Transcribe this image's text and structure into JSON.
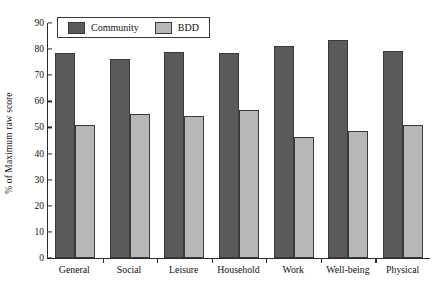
{
  "chart_data": {
    "type": "bar",
    "title": "",
    "xlabel": "",
    "ylabel": "% of Maximum raw score",
    "ylim": [
      0,
      90
    ],
    "ytick_step": 10,
    "yticks": [
      0,
      10,
      20,
      30,
      40,
      50,
      60,
      70,
      80,
      90
    ],
    "grid": false,
    "legend_position": "top-left-inside",
    "categories": [
      "General",
      "Social",
      "Leisure",
      "Household",
      "Work",
      "Well-being",
      "Physical"
    ],
    "series": [
      {
        "name": "Community",
        "color": "#5a5a5a",
        "values": [
          78.7,
          76.2,
          79.0,
          78.4,
          81.3,
          83.5,
          79.4
        ]
      },
      {
        "name": "BDD",
        "color": "#b7b7b7",
        "values": [
          51.0,
          55.0,
          54.3,
          56.5,
          46.5,
          48.5,
          51.0
        ]
      }
    ]
  },
  "colors": {
    "community": "#5a5a5a",
    "bdd": "#b7b7b7",
    "axis": "#2b2b2b",
    "bar_outline": "#3a3a3a",
    "background": "#ffffff"
  }
}
